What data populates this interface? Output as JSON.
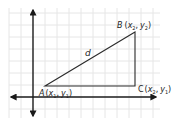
{
  "diagram": {
    "colors": {
      "grid": "#e6e6e6",
      "line": "#2a2a2a",
      "axis": "#1a1a1a",
      "background": "#ffffff"
    },
    "points": {
      "A": {
        "name": "A",
        "coords": "(x1, y1)",
        "x_sub": "1",
        "y_sub": "1"
      },
      "B": {
        "name": "B",
        "coords": "(x2, y2)",
        "x_sub": "2",
        "y_sub": "2"
      },
      "C": {
        "name": "C",
        "coords": "(x2, y1)",
        "x_sub": "2",
        "y_sub": "1"
      }
    },
    "segment_label": "d",
    "labels": {
      "A_name": "A",
      "A_x": "x",
      "A_xs": "1",
      "A_y": "y",
      "A_ys": "1",
      "B_name": "B",
      "B_x": "x",
      "B_xs": "2",
      "B_y": "y",
      "B_ys": "2",
      "C_name": "C",
      "C_x": "x",
      "C_xs": "2",
      "C_y": "y",
      "C_ys": "1",
      "open": "(",
      "comma": ",",
      "close": ")"
    }
  }
}
